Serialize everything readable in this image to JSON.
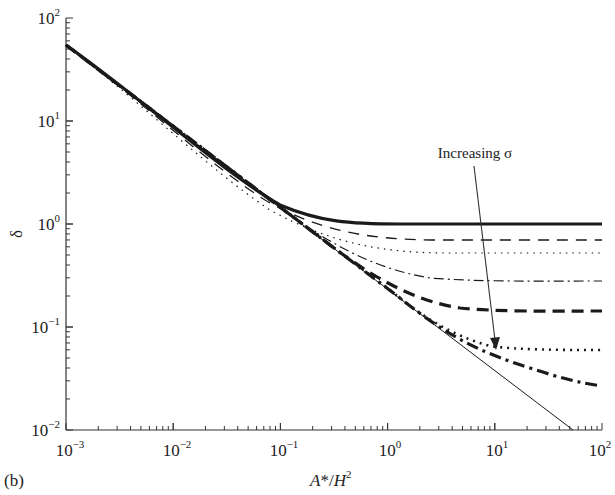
{
  "chart_data": {
    "type": "line",
    "title": "",
    "panel_label": "(b)",
    "xlabel": "A*/H²",
    "ylabel": "δ",
    "xscale": "log",
    "yscale": "log",
    "xlim": [
      0.001,
      100
    ],
    "ylim": [
      0.01,
      100
    ],
    "x_ticks": [
      "10^-3",
      "10^-2",
      "10^-1",
      "10^0",
      "10^1",
      "10^2"
    ],
    "y_ticks": [
      "10^-2",
      "10^-1",
      "10^0",
      "10^1",
      "10^2"
    ],
    "grid": false,
    "legend": null,
    "annotation": {
      "text": "Increasing σ",
      "arrow_from": [
        5.5,
        10
      ],
      "arrow_to": [
        11,
        0.068
      ]
    },
    "x": [
      0.001,
      0.003,
      0.01,
      0.03,
      0.1,
      0.3,
      1,
      3,
      10,
      30,
      100
    ],
    "series": [
      {
        "name": "reference (slope -1/2)",
        "style": "thin-solid",
        "values": [
          15,
          8.7,
          4.8,
          2.75,
          1.5,
          0.87,
          0.48,
          0.275,
          0.15,
          0.087,
          null
        ]
      },
      {
        "name": "σ1",
        "style": "thick-solid",
        "values": [
          15,
          8.9,
          5.0,
          2.9,
          1.35,
          1.03,
          1.0,
          1.0,
          1.0,
          1.0,
          1.0
        ]
      },
      {
        "name": "σ2",
        "style": "dashed",
        "values": [
          15,
          8.8,
          4.9,
          2.8,
          1.2,
          0.82,
          0.72,
          0.7,
          0.7,
          0.7,
          0.7
        ]
      },
      {
        "name": "σ3",
        "style": "dotted",
        "values": [
          15,
          8.8,
          4.9,
          2.8,
          1.1,
          0.7,
          0.55,
          0.52,
          0.52,
          0.52,
          0.52
        ]
      },
      {
        "name": "σ4",
        "style": "dash-dot",
        "values": [
          15,
          8.7,
          4.85,
          2.75,
          1.5,
          0.6,
          0.36,
          0.29,
          0.28,
          0.28,
          0.28
        ]
      },
      {
        "name": "σ5",
        "style": "thick-dashed",
        "values": [
          15,
          8.7,
          4.8,
          2.75,
          1.5,
          0.87,
          0.35,
          0.18,
          0.15,
          0.145,
          0.145
        ]
      },
      {
        "name": "σ6",
        "style": "thick-dotted",
        "values": [
          15,
          8.7,
          4.8,
          2.75,
          1.5,
          0.87,
          0.48,
          0.2,
          0.075,
          0.062,
          0.06
        ]
      },
      {
        "name": "σ7",
        "style": "thick-dash-dot",
        "values": [
          15,
          8.7,
          4.8,
          2.75,
          1.5,
          0.87,
          0.48,
          0.25,
          0.07,
          0.035,
          0.027
        ]
      }
    ]
  },
  "labels": {
    "panel": "(b)",
    "ylabel": "δ",
    "xlabel_a": "A",
    "xlabel_star": "*/",
    "xlabel_h": "H",
    "xlabel_sup": "2",
    "annotation": "Increasing σ",
    "y_ticks": [
      {
        "base": "10",
        "exp": "2"
      },
      {
        "base": "10",
        "exp": "1"
      },
      {
        "base": "10",
        "exp": "0"
      },
      {
        "base": "10",
        "exp": "−1"
      },
      {
        "base": "10",
        "exp": "−2"
      }
    ],
    "x_ticks": [
      {
        "base": "10",
        "exp": "−3"
      },
      {
        "base": "10",
        "exp": "−2"
      },
      {
        "base": "10",
        "exp": "−1"
      },
      {
        "base": "10",
        "exp": "0"
      },
      {
        "base": "10",
        "exp": "1"
      },
      {
        "base": "10",
        "exp": "2"
      }
    ]
  }
}
